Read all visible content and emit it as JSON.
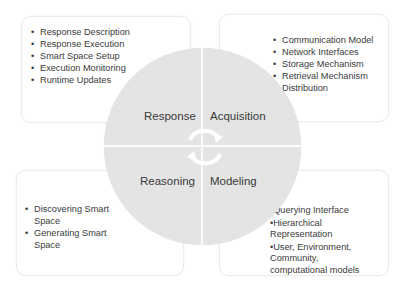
{
  "wheel": {
    "quadrants": [
      {
        "label": "Response"
      },
      {
        "label": "Acquisition"
      },
      {
        "label": "Reasoning"
      },
      {
        "label": "Modeling"
      }
    ],
    "center_icon": "cycle-arrows-icon",
    "colors": {
      "fill": "#e4e4e4",
      "divider": "#fafafa",
      "arrow": "#ffffff"
    }
  },
  "boxes": {
    "response": {
      "items": [
        "Response Description",
        "Response Execution",
        "Smart Space Setup",
        "Execution Monitoring",
        "Runtime Updates"
      ]
    },
    "acquisition": {
      "items": [
        "Communication Model",
        "Network Interfaces",
        "Storage Mechanism",
        "Retrieval Mechanism",
        "Distribution"
      ]
    },
    "reasoning": {
      "items": [
        "Discovering Smart Space",
        "Generating Smart Space"
      ]
    },
    "modeling": {
      "items": [
        "•Querying Interface",
        "•Hierarchical Representation",
        "•User, Environment, Community, computational models"
      ]
    }
  }
}
